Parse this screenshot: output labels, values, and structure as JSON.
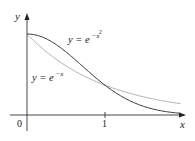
{
  "chart_data": {
    "type": "line",
    "title": "",
    "xlabel": "x",
    "ylabel": "y",
    "xlim": [
      0,
      2
    ],
    "ylim": [
      0,
      1
    ],
    "x_ticks": [
      {
        "value": 0,
        "label": "0"
      },
      {
        "value": 1,
        "label": "1"
      }
    ],
    "grid": false,
    "legend": "inline annotations",
    "x": [
      0,
      0.25,
      0.5,
      0.75,
      1.0,
      1.25,
      1.5,
      1.75,
      2.0
    ],
    "series": [
      {
        "name": "y = e^{-x^2}",
        "label": "y = e",
        "exponent": "−x",
        "exponent_power": "2",
        "color": "#333333",
        "values": [
          1.0,
          0.939,
          0.779,
          0.57,
          0.368,
          0.21,
          0.105,
          0.047,
          0.018
        ]
      },
      {
        "name": "y = e^{-x}",
        "label": "y = e",
        "exponent": "−x",
        "color": "#b0b0b0",
        "values": [
          1.0,
          0.779,
          0.607,
          0.472,
          0.368,
          0.287,
          0.223,
          0.174,
          0.135
        ]
      }
    ],
    "annotations": [
      {
        "text": "y = e^{-x^2}",
        "near": "upper curve, x≈0.5"
      },
      {
        "text": "y = e^{-x}",
        "near": "lower curve, x≈0.3"
      }
    ]
  },
  "axes": {
    "x_label": "x",
    "y_label": "y",
    "origin_label": "0",
    "tick_one_label": "1"
  }
}
